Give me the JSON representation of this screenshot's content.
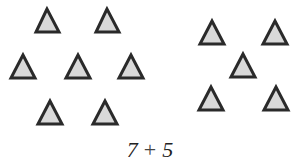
{
  "figure": {
    "colors": {
      "fill": "#d9d9d9",
      "stroke": "#2a2a2a"
    },
    "groups": [
      {
        "name": "left-group",
        "count": 7,
        "triangles": [
          {
            "apex": [
              47,
              9
            ],
            "left": [
              36,
              32
            ],
            "right": [
              59,
              32
            ]
          },
          {
            "apex": [
              107,
              9
            ],
            "left": [
              96,
              32
            ],
            "right": [
              119,
              32
            ]
          },
          {
            "apex": [
              23,
              55
            ],
            "left": [
              11,
              78
            ],
            "right": [
              35,
              78
            ]
          },
          {
            "apex": [
              78,
              55
            ],
            "left": [
              66,
              78
            ],
            "right": [
              90,
              78
            ]
          },
          {
            "apex": [
              131,
              55
            ],
            "left": [
              119,
              78
            ],
            "right": [
              143,
              78
            ]
          },
          {
            "apex": [
              50,
              101
            ],
            "left": [
              38,
              124
            ],
            "right": [
              62,
              124
            ]
          },
          {
            "apex": [
              105,
              101
            ],
            "left": [
              93,
              124
            ],
            "right": [
              117,
              124
            ]
          }
        ]
      },
      {
        "name": "right-group",
        "count": 5,
        "triangles": [
          {
            "apex": [
              212,
              21
            ],
            "left": [
              200,
              44
            ],
            "right": [
              224,
              44
            ]
          },
          {
            "apex": [
              275,
              21
            ],
            "left": [
              263,
              44
            ],
            "right": [
              287,
              44
            ]
          },
          {
            "apex": [
              243,
              54
            ],
            "left": [
              231,
              77
            ],
            "right": [
              255,
              77
            ]
          },
          {
            "apex": [
              211,
              87
            ],
            "left": [
              199,
              110
            ],
            "right": [
              223,
              110
            ]
          },
          {
            "apex": [
              276,
              87
            ],
            "left": [
              264,
              110
            ],
            "right": [
              288,
              110
            ]
          }
        ]
      }
    ]
  },
  "expression": {
    "left_operand": "7",
    "operator": "+",
    "right_operand": "5"
  }
}
